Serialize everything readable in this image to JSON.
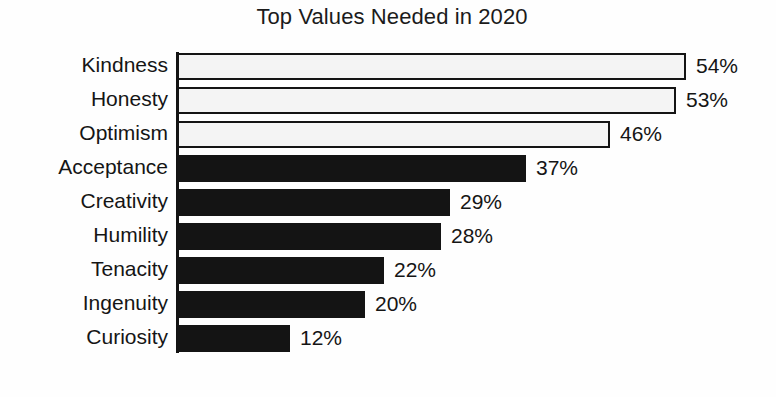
{
  "chart_data": {
    "type": "bar",
    "orientation": "horizontal",
    "title": "Top Values Needed in 2020",
    "xlabel": "",
    "ylabel": "",
    "xlim": [
      0,
      60
    ],
    "grid": false,
    "legend": false,
    "value_suffix": "%",
    "categories": [
      "Kindness",
      "Honesty",
      "Optimism",
      "Acceptance",
      "Creativity",
      "Humility",
      "Tenacity",
      "Ingenuity",
      "Curiosity"
    ],
    "values": [
      54,
      53,
      46,
      37,
      29,
      28,
      22,
      20,
      12
    ],
    "value_labels": [
      "54%",
      "53%",
      "46%",
      "37%",
      "29%",
      "28%",
      "22%",
      "20%",
      "12%"
    ],
    "bar_styles": [
      "light",
      "light",
      "light",
      "dark",
      "dark",
      "dark",
      "dark",
      "dark",
      "dark"
    ],
    "colors": {
      "dark_fill": "#141414",
      "light_fill": "#f4f4f4",
      "bar_outline": "#141414",
      "text": "#151515",
      "background": "#fefefe"
    },
    "bars": [
      {
        "label": "Kindness",
        "value": 54,
        "value_label": "54%",
        "style": "light"
      },
      {
        "label": "Honesty",
        "value": 53,
        "value_label": "53%",
        "style": "light"
      },
      {
        "label": "Optimism",
        "value": 46,
        "value_label": "46%",
        "style": "light"
      },
      {
        "label": "Acceptance",
        "value": 37,
        "value_label": "37%",
        "style": "dark"
      },
      {
        "label": "Creativity",
        "value": 29,
        "value_label": "29%",
        "style": "dark"
      },
      {
        "label": "Humility",
        "value": 28,
        "value_label": "28%",
        "style": "dark"
      },
      {
        "label": "Tenacity",
        "value": 22,
        "value_label": "22%",
        "style": "dark"
      },
      {
        "label": "Ingenuity",
        "value": 20,
        "value_label": "20%",
        "style": "dark"
      },
      {
        "label": "Curiosity",
        "value": 12,
        "value_label": "12%",
        "style": "dark"
      }
    ]
  }
}
